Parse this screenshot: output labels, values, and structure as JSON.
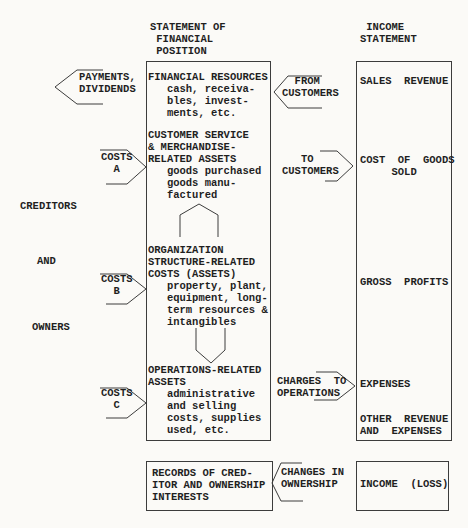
{
  "headers": {
    "financial_position": "STATEMENT OF\n FINANCIAL\n POSITION",
    "income_statement": " INCOME\nSTATEMENT"
  },
  "external_labels": {
    "payments_dividends": "PAYMENTS,\nDIVIDENDS",
    "creditors": "CREDITORS",
    "and": "AND",
    "owners": "OWNERS"
  },
  "cost_arrows": {
    "costs_a": "COSTS\n  A",
    "costs_b": "COSTS\n  B",
    "costs_c": "COSTS\n  C"
  },
  "flow_arrows": {
    "from_customers": "  FROM\nCUSTOMERS",
    "to_customers": "   TO\nCUSTOMERS",
    "charges_to_operations": "CHARGES  TO\nOPERATIONS",
    "changes_in_ownership": "CHANGES IN\nOWNERSHIP"
  },
  "financial_position_box": {
    "financial_resources": "FINANCIAL RESOURCES\n   cash, receiva-\n   bles, invest-\n   ments, etc.",
    "customer_service": "CUSTOMER SERVICE\n& MERCHANDISE-\nRELATED ASSETS\n   goods purchased\n   goods manu-\n   factured",
    "organization_structure": "ORGANIZATION\nSTRUCTURE-RELATED\nCOSTS (ASSETS)\n   property, plant,\n   equipment, long-\n   term resources &\n   intangibles",
    "operations_related": "OPERATIONS-RELATED\nASSETS\n   administrative\n   and selling\n   costs, supplies\n   used, etc."
  },
  "income_statement_box": {
    "sales_revenue": "SALES  REVENUE",
    "cost_of_goods_sold": "COST  OF  GOODS\n     SOLD",
    "gross_profits": "GROSS  PROFITS",
    "expenses": "EXPENSES",
    "other_revenue_and_expenses": "OTHER  REVENUE\nAND  EXPENSES"
  },
  "bottom_row": {
    "records_of_creditor": "RECORDS OF CRED-\nITOR AND OWNERSHIP\nINTERESTS",
    "income_loss": "INCOME  (LOSS)"
  },
  "colors": {
    "paper": "#fbfaf7",
    "ink": "#1f1f1f",
    "line": "#3c3c3c"
  }
}
